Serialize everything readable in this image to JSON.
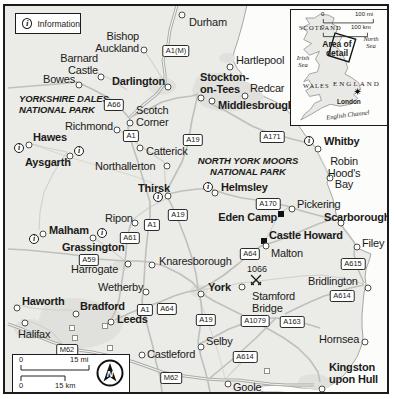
{
  "legend": {
    "info_label": "Information"
  },
  "scalebar": {
    "mi_zero": "0",
    "mi_label": "15 mi",
    "km_zero": "0",
    "km_label": "15 km",
    "compass_n": "N"
  },
  "inset": {
    "scotland": "SCOTLAND",
    "wales": "WALES",
    "england": "ENGLAND",
    "london": "London",
    "north_sea": "North\nSea",
    "irish_sea": "Irish\nSea",
    "english_channel": "English Channel",
    "area_of_detail": "Area of\ndetail",
    "scale_mi_zero": "0",
    "scale_mi": "100 mi",
    "scale_km_zero": "0",
    "scale_km": "100 km"
  },
  "battle": {
    "label": "1066"
  },
  "map": {
    "colors": {
      "land": "#ebebe8",
      "sea": "#fcfcfb",
      "urban": "#e0e0dd",
      "road": "#bfbfbb",
      "frame": "#1b1b19"
    },
    "parks": [
      {
        "name": "YORKSHIRE DALES\nNATIONAL PARK",
        "x": 14,
        "y": 87,
        "align": "left"
      },
      {
        "name": "NORTH YORK MOORS\nNATIONAL PARK",
        "x": 243,
        "y": 149,
        "align": "center"
      }
    ],
    "towns": [
      {
        "name": "Durham",
        "bold": false,
        "marker": "circle",
        "dx": 177,
        "dy": 9,
        "lx": 184,
        "ly": 11,
        "align": "left"
      },
      {
        "name": "Bishop\nAuckland",
        "bold": false,
        "marker": "circle",
        "dx": 139,
        "dy": 44,
        "lx": 134,
        "ly": 25,
        "align": "right"
      },
      {
        "name": "Hartlepool",
        "bold": false,
        "marker": "circle",
        "dx": 225,
        "dy": 61,
        "lx": 231,
        "ly": 49,
        "align": "left"
      },
      {
        "name": "Barnard\nCastle",
        "bold": false,
        "marker": "circle",
        "dx": 96,
        "dy": 71,
        "lx": 93,
        "ly": 47,
        "align": "right"
      },
      {
        "name": "Bowes",
        "bold": false,
        "marker": "circle",
        "dx": 74,
        "dy": 79,
        "lx": 38,
        "ly": 68,
        "align": "left"
      },
      {
        "name": "Darlington",
        "bold": true,
        "marker": "circle",
        "dx": 163,
        "dy": 81,
        "lx": 107,
        "ly": 70,
        "align": "left"
      },
      {
        "name": "Stockton-\non-Tees",
        "bold": true,
        "marker": "circle",
        "dx": 196,
        "dy": 92,
        "lx": 195,
        "ly": 66,
        "align": "left"
      },
      {
        "name": "Redcar",
        "bold": false,
        "marker": "circle",
        "dx": 240,
        "dy": 90,
        "lx": 245,
        "ly": 77,
        "align": "left"
      },
      {
        "name": "Middlesbrough",
        "bold": true,
        "marker": "circle",
        "dx": 207,
        "dy": 95,
        "lx": 213,
        "ly": 94,
        "align": "left"
      },
      {
        "name": "Scotch\nCorner",
        "bold": false,
        "marker": "circle",
        "dx": 125,
        "dy": 117,
        "lx": 131,
        "ly": 99,
        "align": "left"
      },
      {
        "name": "Richmond",
        "bold": false,
        "marker": "circle",
        "dx": 112,
        "dy": 124,
        "lx": 60,
        "ly": 115,
        "align": "left"
      },
      {
        "name": "Hawes",
        "bold": true,
        "marker": "circle",
        "dx": 24,
        "dy": 139,
        "lx": 28,
        "ly": 126,
        "align": "left"
      },
      {
        "name": "Catterick",
        "bold": false,
        "marker": "circle",
        "dx": 135,
        "dy": 142,
        "lx": 141,
        "ly": 140,
        "align": "left"
      },
      {
        "name": "Aysgarth",
        "bold": true,
        "marker": "circle",
        "dx": 65,
        "dy": 150,
        "lx": 20,
        "ly": 151,
        "align": "left"
      },
      {
        "name": "Northallerton",
        "bold": false,
        "marker": "circle",
        "dx": 162,
        "dy": 160,
        "lx": 90,
        "ly": 155,
        "align": "left"
      },
      {
        "name": "Whitby",
        "bold": true,
        "marker": "circle",
        "dx": 313,
        "dy": 143,
        "lx": 319,
        "ly": 130,
        "align": "left"
      },
      {
        "name": "Thirsk",
        "bold": true,
        "marker": "circle",
        "dx": 163,
        "dy": 190,
        "lx": 133,
        "ly": 177,
        "align": "left"
      },
      {
        "name": "Helmsley",
        "bold": true,
        "marker": "circle",
        "dx": 210,
        "dy": 187,
        "lx": 216,
        "ly": 176,
        "align": "left"
      },
      {
        "name": "Robin Hood's\nBay",
        "bold": false,
        "marker": "circle",
        "dx": 325,
        "dy": 172,
        "lx": 339,
        "ly": 150,
        "align": "center"
      },
      {
        "name": "Pickering",
        "bold": false,
        "marker": "circle",
        "dx": 287,
        "dy": 203,
        "lx": 292,
        "ly": 193,
        "align": "left"
      },
      {
        "name": "Scarborough",
        "bold": true,
        "marker": "circle",
        "dx": 336,
        "dy": 217,
        "lx": 319,
        "ly": 206,
        "align": "left"
      },
      {
        "name": "Eden Camp",
        "bold": true,
        "marker": "square",
        "dx": 276,
        "dy": 208,
        "lx": 272,
        "ly": 206,
        "align": "right"
      },
      {
        "name": "Ripon",
        "bold": false,
        "marker": "circle",
        "dx": 130,
        "dy": 217,
        "lx": 100,
        "ly": 207,
        "align": "left"
      },
      {
        "name": "Malham",
        "bold": true,
        "marker": "circle",
        "dx": 38,
        "dy": 228,
        "lx": 44,
        "ly": 219,
        "align": "left"
      },
      {
        "name": "Castle Howard",
        "bold": true,
        "marker": "square",
        "dx": 259,
        "dy": 235,
        "lx": 264,
        "ly": 224,
        "align": "left"
      },
      {
        "name": "Grassington",
        "bold": true,
        "marker": "circle",
        "dx": 88,
        "dy": 232,
        "lx": 57,
        "ly": 236,
        "align": "left"
      },
      {
        "name": "Malton",
        "bold": false,
        "marker": "circle",
        "dx": 261,
        "dy": 240,
        "lx": 266,
        "ly": 242,
        "align": "left"
      },
      {
        "name": "Filey",
        "bold": false,
        "marker": "circle",
        "dx": 352,
        "dy": 241,
        "lx": 357,
        "ly": 232,
        "align": "left"
      },
      {
        "name": "Knaresborough",
        "bold": false,
        "marker": "circle",
        "dx": 147,
        "dy": 259,
        "lx": 154,
        "ly": 250,
        "align": "left"
      },
      {
        "name": "Harrogate",
        "bold": false,
        "marker": "circle",
        "dx": 123,
        "dy": 258,
        "lx": 66,
        "ly": 258,
        "align": "left"
      },
      {
        "name": "Wetherby",
        "bold": false,
        "marker": "circle",
        "dx": 141,
        "dy": 286,
        "lx": 93,
        "ly": 276,
        "align": "left"
      },
      {
        "name": "Haworth",
        "bold": true,
        "marker": "circle",
        "dx": 12,
        "dy": 302,
        "lx": 17,
        "ly": 290,
        "align": "left"
      },
      {
        "name": "Bradford",
        "bold": true,
        "marker": "circle",
        "dx": 71,
        "dy": 308,
        "lx": 75,
        "ly": 295,
        "align": "left"
      },
      {
        "name": "Leeds",
        "bold": true,
        "marker": "circle",
        "dx": 106,
        "dy": 316,
        "lx": 112,
        "ly": 308,
        "align": "left"
      },
      {
        "name": "Halifax",
        "bold": false,
        "marker": "circle",
        "dx": 20,
        "dy": 317,
        "lx": 13,
        "ly": 323,
        "align": "left"
      },
      {
        "name": "York",
        "bold": true,
        "marker": "circle",
        "dx": 196,
        "dy": 288,
        "lx": 203,
        "ly": 276,
        "align": "left"
      },
      {
        "name": "Stamford\nBridge",
        "bold": false,
        "marker": "circle",
        "dx": 237,
        "dy": 281,
        "lx": 247,
        "ly": 285,
        "align": "left"
      },
      {
        "name": "Bridlington",
        "bold": false,
        "marker": "circle",
        "dx": 363,
        "dy": 282,
        "lx": 303,
        "ly": 270,
        "align": "left"
      },
      {
        "name": "Selby",
        "bold": false,
        "marker": "circle",
        "dx": 196,
        "dy": 341,
        "lx": 201,
        "ly": 330,
        "align": "left"
      },
      {
        "name": "Castleford",
        "bold": false,
        "marker": "circle",
        "dx": 137,
        "dy": 349,
        "lx": 142,
        "ly": 343,
        "align": "left"
      },
      {
        "name": "Hornsea",
        "bold": false,
        "marker": "circle",
        "dx": 360,
        "dy": 336,
        "lx": 314,
        "ly": 328,
        "align": "left"
      },
      {
        "name": "Goole",
        "bold": false,
        "marker": "circle",
        "dx": 223,
        "dy": 378,
        "lx": 228,
        "ly": 376,
        "align": "left"
      },
      {
        "name": "Kingston\nupon Hull",
        "bold": true,
        "marker": "circle",
        "dx": 317,
        "dy": 383,
        "lx": 324,
        "ly": 356,
        "align": "left"
      }
    ],
    "badges": [
      {
        "label": "A1(M)",
        "x": 171,
        "y": 45
      },
      {
        "label": "A66",
        "x": 109,
        "y": 99
      },
      {
        "label": "A1",
        "x": 126,
        "y": 130
      },
      {
        "label": "A19",
        "x": 188,
        "y": 134
      },
      {
        "label": "A171",
        "x": 267,
        "y": 131
      },
      {
        "label": "A170",
        "x": 263,
        "y": 198
      },
      {
        "label": "A19",
        "x": 173,
        "y": 209
      },
      {
        "label": "A1",
        "x": 147,
        "y": 219
      },
      {
        "label": "A61",
        "x": 125,
        "y": 232
      },
      {
        "label": "A59",
        "x": 84,
        "y": 254
      },
      {
        "label": "A64",
        "x": 245,
        "y": 248
      },
      {
        "label": "A615",
        "x": 348,
        "y": 258
      },
      {
        "label": "A64",
        "x": 162,
        "y": 303
      },
      {
        "label": "A1",
        "x": 140,
        "y": 304
      },
      {
        "label": "A19",
        "x": 201,
        "y": 314
      },
      {
        "label": "A1079",
        "x": 250,
        "y": 315
      },
      {
        "label": "A163",
        "x": 287,
        "y": 316
      },
      {
        "label": "A614",
        "x": 337,
        "y": 290
      },
      {
        "label": "M62",
        "x": 62,
        "y": 344
      },
      {
        "label": "A614",
        "x": 240,
        "y": 351
      },
      {
        "label": "M62",
        "x": 166,
        "y": 372
      }
    ],
    "info_icons": [
      {
        "x": 14,
        "y": 142
      },
      {
        "x": 74,
        "y": 145
      },
      {
        "x": 29,
        "y": 233
      },
      {
        "x": 97,
        "y": 227
      },
      {
        "x": 153,
        "y": 191
      },
      {
        "x": 203,
        "y": 181
      },
      {
        "x": 304,
        "y": 135
      }
    ],
    "junctions": [
      {
        "x": 67,
        "y": 322
      },
      {
        "x": 100,
        "y": 320
      },
      {
        "x": 70,
        "y": 332
      },
      {
        "x": 105,
        "y": 342
      },
      {
        "x": 262,
        "y": 365
      }
    ],
    "battle_site": {
      "label_x": 252,
      "label_y": 258,
      "icon_x": 251,
      "icon_y": 274
    }
  }
}
